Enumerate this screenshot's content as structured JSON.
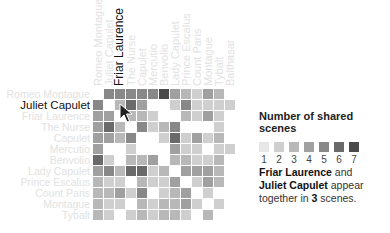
{
  "chart_data": {
    "type": "heatmap",
    "legend_title": "Number of shared scenes",
    "legend_values": [
      1,
      2,
      3,
      4,
      5,
      6,
      7
    ],
    "legend_colors": [
      "#e6e6e6",
      "#cfcfcf",
      "#b8b8b8",
      "#a0a0a0",
      "#888888",
      "#6a6a6a",
      "#4a4a4a"
    ],
    "columns": [
      "Romeo Montague",
      "Juliet Capulet",
      "Friar Laurence",
      "The Nurse",
      "Capulet",
      "Mercutio",
      "Benvolio",
      "Lady Capulet",
      "Prince Escalus",
      "Count Paris",
      "Montague",
      "Tybalt",
      "Balthasar"
    ],
    "rows": [
      "Romeo Montague",
      "Juliet Capulet",
      "Friar Laurence",
      "The Nurse",
      "Capulet",
      "Mercutio",
      "Benvolio",
      "Lady Capulet",
      "Prince Escalus",
      "Count Paris",
      "Montague",
      "Tybalt"
    ],
    "matrix": [
      [
        0,
        5,
        5,
        5,
        5,
        5,
        7,
        4,
        3,
        2,
        4,
        3,
        0
      ],
      [
        5,
        0,
        3,
        6,
        4,
        0,
        0,
        2,
        5,
        2,
        2,
        2,
        2
      ],
      [
        4,
        4,
        0,
        3,
        3,
        2,
        0,
        0,
        3,
        2,
        4,
        2,
        0
      ],
      [
        4,
        6,
        3,
        0,
        5,
        2,
        3,
        5,
        0,
        0,
        0,
        2,
        0
      ],
      [
        4,
        4,
        3,
        5,
        0,
        0,
        2,
        6,
        2,
        4,
        2,
        3,
        0
      ],
      [
        4,
        0,
        0,
        2,
        0,
        0,
        0,
        4,
        2,
        2,
        0,
        2,
        2
      ],
      [
        6,
        2,
        0,
        3,
        3,
        4,
        0,
        3,
        3,
        2,
        2,
        3,
        0
      ],
      [
        4,
        5,
        3,
        6,
        6,
        2,
        3,
        0,
        4,
        4,
        4,
        3,
        0
      ],
      [
        3,
        2,
        2,
        0,
        3,
        2,
        2,
        4,
        0,
        2,
        4,
        3,
        0
      ],
      [
        3,
        3,
        4,
        2,
        5,
        0,
        2,
        3,
        4,
        0,
        2,
        0,
        0
      ],
      [
        3,
        2,
        2,
        0,
        3,
        2,
        3,
        3,
        4,
        2,
        0,
        2,
        0
      ],
      [
        3,
        2,
        0,
        2,
        3,
        2,
        3,
        3,
        2,
        0,
        3,
        0,
        0
      ]
    ],
    "highlight": {
      "row": "Juliet Capulet",
      "column": "Friar Laurence",
      "value": 3
    }
  },
  "labels": {
    "active_column": "Friar Laurence",
    "active_row": "Juliet Capulet"
  },
  "legend": {
    "title": "Number of shared scenes",
    "values": [
      "1",
      "2",
      "3",
      "4",
      "5",
      "6",
      "7"
    ]
  },
  "caption": {
    "name_a": "Friar Laurence",
    "connector": " and ",
    "name_b": "Juliet Capulet",
    "middle": " appear together in ",
    "count": "3",
    "suffix": " scenes."
  }
}
